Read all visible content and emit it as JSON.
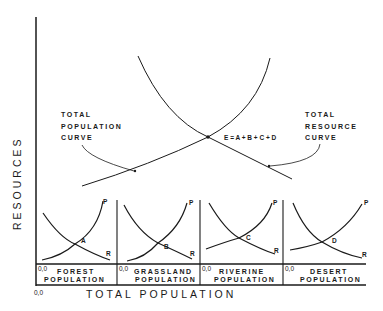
{
  "diagram": {
    "y_axis_label": "RESOURCES",
    "x_axis_label": "TOTAL POPULATION",
    "origin_label": "0,0",
    "total_population_curve": {
      "label_lines": [
        "TOTAL",
        "POPULATION",
        "CURVE"
      ]
    },
    "total_resource_curve": {
      "label_lines": [
        "TOTAL",
        "RESOURCE",
        "CURVE"
      ]
    },
    "equilibrium_label": "E = A + B + C + D",
    "panels": [
      {
        "name": "forest",
        "label_lines": [
          "FOREST",
          "POPULATION"
        ],
        "origin": "0,0",
        "point": "A",
        "curve_p": "P",
        "curve_r": "R"
      },
      {
        "name": "grassland",
        "label_lines": [
          "GRASSLAND",
          "POPULATION"
        ],
        "origin": "0,0",
        "point": "B",
        "curve_p": "P",
        "curve_r": "R"
      },
      {
        "name": "riverine",
        "label_lines": [
          "RIVERINE",
          "POPULATION"
        ],
        "origin": "0,0",
        "point": "C",
        "curve_p": "P",
        "curve_r": "R"
      },
      {
        "name": "desert",
        "label_lines": [
          "DESERT",
          "POPULATION"
        ],
        "origin": "0,0",
        "point": "D",
        "curve_p": "P",
        "curve_r": "R"
      }
    ]
  }
}
